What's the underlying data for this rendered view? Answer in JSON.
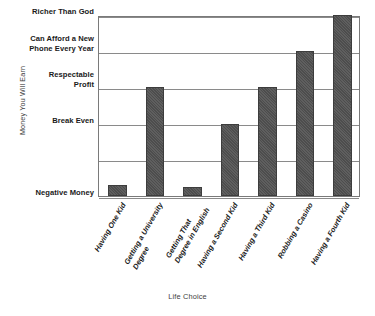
{
  "chart_data": {
    "type": "bar",
    "title": "",
    "xlabel": "Life Choice",
    "ylabel": "Money You Will Earn",
    "categories": [
      "Having One Kid",
      "Getting a University Degree",
      "Getting That Degree in English",
      "Having a Second Kid",
      "Having a Third Kid",
      "Robbing a Casino",
      "Having a Fourth Kid"
    ],
    "category_lines": [
      [
        "Having One Kid"
      ],
      [
        "Getting a University",
        "Degree"
      ],
      [
        "Getting That",
        "Degree in English"
      ],
      [
        "Having a Second Kid"
      ],
      [
        "Having a Third Kid"
      ],
      [
        "Robbing a Casino"
      ],
      [
        "Having a Fourth Kid"
      ]
    ],
    "values": [
      0.3,
      3.0,
      0.25,
      2.0,
      3.0,
      4.0,
      5.0
    ],
    "value_labels": [
      "just above Negative Money",
      "Respectable Profit",
      "just above Negative Money",
      "Break Even",
      "Respectable Profit",
      "Can Afford a New Phone Every Year",
      "Richer Than God"
    ],
    "ytick_values": [
      0,
      1,
      2,
      3,
      4,
      5
    ],
    "yticklabels": [
      "Negative Money",
      "",
      "Break Even",
      "Respectable Profit",
      "Can Afford a New Phone Every Year",
      "Richer Than God"
    ],
    "ytick_lines": [
      [
        "Negative Money"
      ],
      [
        ""
      ],
      [
        "Break Even"
      ],
      [
        "Respectable",
        "Profit"
      ],
      [
        "Can Afford a New",
        "Phone Every Year"
      ],
      [
        "Richer Than God"
      ]
    ],
    "ylim": [
      0,
      5
    ],
    "grid": true,
    "grid_axis": "y",
    "legend": false,
    "legend_position": "none",
    "bar_color": "#4d4d4d",
    "grid_color": "#8a8a8a",
    "axis_color": "#7a7a7a",
    "background_color": "#ffffff"
  },
  "axes": {
    "y_title": "Money You Will Earn",
    "x_title": "Life Choice"
  }
}
